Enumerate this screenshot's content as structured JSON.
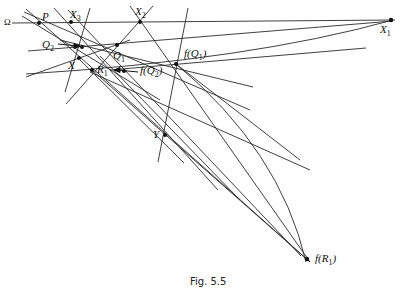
{
  "figure": {
    "caption": "Fig. 5.5",
    "axis_label": "Ω"
  },
  "points": {
    "P": "P",
    "X3": "X",
    "X3_sub": "3",
    "X2": "X",
    "X2_sub": "2",
    "X1": "X",
    "X1_sub": "1",
    "Q2": "Q",
    "Q2_sub": "2",
    "Q1": "Q",
    "Q1_sub": "1",
    "X": "X",
    "R1": "R",
    "R1_sub": "1",
    "fQ2_pre": "f(Q",
    "fQ2_sub": "2",
    "fQ2_post": ")",
    "fQ1_pre": "f(Q",
    "fQ1_sub": "1",
    "fQ1_post": ")",
    "Y": "Y",
    "fR1_pre": "f(R",
    "fR1_sub": "1",
    "fR1_post": ")"
  },
  "colors": {
    "line": "#2a2a2a",
    "background": "#ffffff"
  }
}
